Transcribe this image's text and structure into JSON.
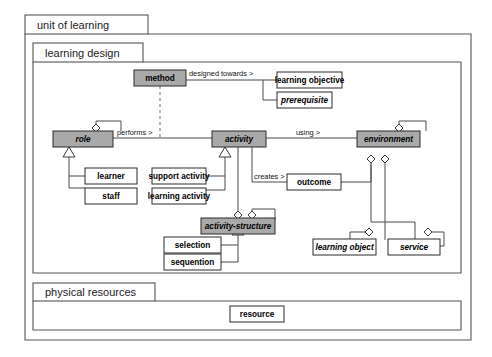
{
  "diagram": {
    "title": "unit of learning",
    "type": "uml-class-diagram",
    "packages": [
      {
        "id": "unit-of-learning",
        "label": "unit of learning"
      },
      {
        "id": "learning-design",
        "label": "learning design"
      },
      {
        "id": "physical-resources",
        "label": "physical resources"
      }
    ],
    "classes": [
      {
        "id": "method",
        "label": "method",
        "fill": "#a9a9a9",
        "style": "bold"
      },
      {
        "id": "learning-objective",
        "label": "learning objective",
        "fill": "#ffffff",
        "style": "bold"
      },
      {
        "id": "prerequisite",
        "label": "prerequisite",
        "fill": "#ffffff",
        "style": "bold-italic"
      },
      {
        "id": "role",
        "label": "role",
        "fill": "#a9a9a9",
        "style": "bold-italic"
      },
      {
        "id": "activity",
        "label": "activity",
        "fill": "#a9a9a9",
        "style": "bold-italic"
      },
      {
        "id": "environment",
        "label": "environment",
        "fill": "#a9a9a9",
        "style": "bold-italic"
      },
      {
        "id": "learner",
        "label": "learner",
        "fill": "#ffffff",
        "style": "bold"
      },
      {
        "id": "staff",
        "label": "staff",
        "fill": "#ffffff",
        "style": "bold"
      },
      {
        "id": "support-activity",
        "label": "support activity",
        "fill": "#ffffff",
        "style": "bold"
      },
      {
        "id": "learning-activity",
        "label": "learning activity",
        "fill": "#ffffff",
        "style": "bold"
      },
      {
        "id": "outcome",
        "label": "outcome",
        "fill": "#ffffff",
        "style": "bold"
      },
      {
        "id": "activity-structure",
        "label": "activity-structure",
        "fill": "#a9a9a9",
        "style": "bold-italic"
      },
      {
        "id": "selection",
        "label": "selection",
        "fill": "#ffffff",
        "style": "bold"
      },
      {
        "id": "sequention",
        "label": "sequention",
        "fill": "#ffffff",
        "style": "bold"
      },
      {
        "id": "learning-object",
        "label": "learning object",
        "fill": "#ffffff",
        "style": "bold-italic"
      },
      {
        "id": "service",
        "label": "service",
        "fill": "#ffffff",
        "style": "bold-italic"
      },
      {
        "id": "resource",
        "label": "resource",
        "fill": "#ffffff",
        "style": "bold"
      }
    ],
    "association_labels": [
      {
        "id": "designed-towards",
        "label": "designed towards >",
        "from": "method",
        "to": "learning-objective"
      },
      {
        "id": "performs",
        "label": "performs >",
        "from": "role",
        "to": "activity"
      },
      {
        "id": "using",
        "label": "using >",
        "from": "activity",
        "to": "environment"
      },
      {
        "id": "creates",
        "label": "creates >",
        "from": "activity",
        "to": "outcome"
      }
    ],
    "colors": {
      "abstract_fill": "#a9a9a9",
      "concrete_fill": "#ffffff",
      "line": "#4a4a4a",
      "border": "#2b2b2b",
      "background": "#ffffff"
    }
  }
}
